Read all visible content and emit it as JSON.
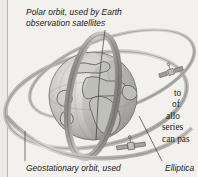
{
  "figure": {
    "background_color": "#f2f1ee",
    "ink_color": "#1d1d1d",
    "globe_color": "#c9c8c4",
    "orbit_color": "#8e8d89"
  },
  "captions": {
    "polar_orbit": "Polar orbit, used by Earth\nobservation satellites",
    "geostationary_orbit": "Geostationary orbit, used",
    "elliptical_orbit": "Elliptica"
  },
  "body_text": {
    "lines": [
      "to",
      "of",
      "allo",
      "series",
      "can pas"
    ]
  },
  "labels": {
    "globe": "Earth",
    "polar_orbit_band": "polar orbit band",
    "geostationary_ring": "geostationary orbit ring",
    "elliptical_ring": "elliptical orbit ring",
    "satellite_right": "satellite",
    "satellite_bottom": "satellite"
  }
}
